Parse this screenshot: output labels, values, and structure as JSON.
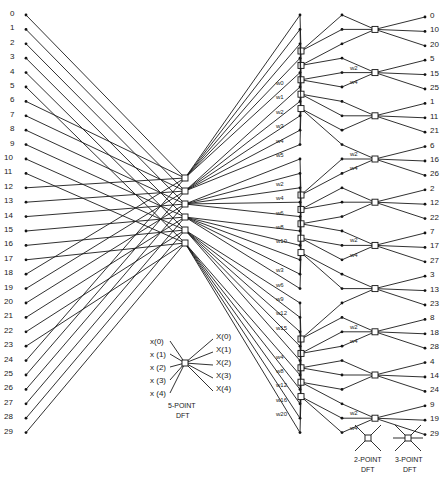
{
  "diagram": {
    "inputs": [
      "0",
      "1",
      "2",
      "3",
      "4",
      "5",
      "6",
      "7",
      "8",
      "9",
      "10",
      "11",
      "12",
      "13",
      "14",
      "15",
      "16",
      "17",
      "18",
      "19",
      "20",
      "21",
      "22",
      "23",
      "24",
      "25",
      "26",
      "27",
      "28",
      "29"
    ],
    "outputs": [
      "0",
      "10",
      "20",
      "5",
      "15",
      "25",
      "1",
      "11",
      "21",
      "6",
      "16",
      "26",
      "2",
      "12",
      "22",
      "7",
      "17",
      "27",
      "3",
      "13",
      "23",
      "8",
      "18",
      "28",
      "4",
      "14",
      "24",
      "9",
      "19",
      "29"
    ],
    "stage1_twiddles": [
      "W0",
      "W0",
      "W0",
      "W0",
      "W0",
      "W0",
      "W1",
      "W2",
      "W3",
      "W4",
      "W5",
      "W0",
      "W2",
      "W4",
      "W6",
      "W8",
      "W10",
      "W0",
      "W3",
      "W6",
      "W9",
      "W12",
      "W15",
      "W0",
      "W4",
      "W8",
      "W12",
      "W16",
      "W20",
      "W0"
    ],
    "stage2_twiddles": [
      "W0",
      "W2",
      "W4",
      "W0",
      "W2",
      "W4",
      "W0",
      "W2",
      "W4",
      "W0",
      "W2",
      "W4",
      "W0",
      "W2",
      "W4"
    ],
    "legend": {
      "five_point": {
        "inputs": [
          "x(0)",
          "x (1)",
          "x (2)",
          "x (3)",
          "x (4)"
        ],
        "outputs": [
          "X(0)",
          "X(1)",
          "X(2)",
          "X(3)",
          "X(4)"
        ],
        "caption_line1": "5-POINT",
        "caption_line2": "DFT"
      },
      "two_point": {
        "caption_line1": "2-POINT",
        "caption_line2": "DFT"
      },
      "three_point": {
        "caption_line1": "3-POINT",
        "caption_line2": "DFT"
      }
    },
    "colors": {
      "line": "#1a1a1a",
      "background": "#ffffff"
    }
  }
}
